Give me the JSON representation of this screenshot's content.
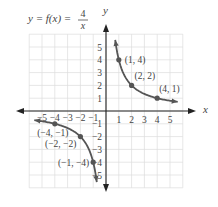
{
  "chart_data": {
    "type": "line",
    "equation": {
      "lhs": "y = f(x) =",
      "numerator": "4",
      "denominator": "x"
    },
    "xlabel": "x",
    "ylabel": "y",
    "xlim": [
      -6,
      6
    ],
    "ylim": [
      -6,
      6
    ],
    "grid": true,
    "x_ticks": [
      -5,
      -4,
      -3,
      -2,
      -1,
      1,
      2,
      3,
      4,
      5
    ],
    "y_ticks": [
      -5,
      -4,
      -3,
      -2,
      -1,
      1,
      2,
      3,
      4,
      5
    ],
    "x_tick_labels": [
      "−5",
      "−4",
      "−3",
      "−2",
      "−1",
      "1",
      "2",
      "3",
      "4",
      "5"
    ],
    "y_tick_labels": [
      "−5",
      "−4",
      "−3",
      "−2",
      "−1",
      "1",
      "2",
      "3",
      "4",
      "5"
    ],
    "series": [
      {
        "name": "f(x) = 4/x (x > 0)",
        "function": "4/x",
        "domain": [
          0.72,
          5.6
        ],
        "color": "#555555"
      },
      {
        "name": "f(x) = 4/x (x < 0)",
        "function": "4/x",
        "domain": [
          -5.6,
          -0.72
        ],
        "color": "#555555"
      }
    ],
    "points": [
      {
        "x": 1,
        "y": 4,
        "label": "(1, 4)"
      },
      {
        "x": 2,
        "y": 2,
        "label": "(2, 2)"
      },
      {
        "x": 4,
        "y": 1,
        "label": "(4, 1)"
      },
      {
        "x": -4,
        "y": -1,
        "label": "(−4, −1)"
      },
      {
        "x": -2,
        "y": -2,
        "label": "(−2, −2)"
      },
      {
        "x": -1,
        "y": -4,
        "label": "(−1, −4)"
      }
    ]
  },
  "colors": {
    "axis": "#222222",
    "curve": "#555555",
    "grid": "#dcdcdc",
    "text": "#444444"
  }
}
